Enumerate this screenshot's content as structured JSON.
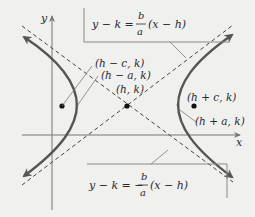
{
  "diagram": {
    "colors": {
      "background": "#f0f0ef",
      "curve": "#555555",
      "asymptote": "#444444",
      "axis": "#777777",
      "leader": "#7a7a7a",
      "point": "#111111",
      "text": "#2a2a2a"
    },
    "axes": {
      "x_label": "x",
      "y_label": "y"
    },
    "asymptotes": {
      "upper_right": {
        "lhs": "y − k =",
        "numerator": "b",
        "denominator": "a",
        "rhs": "(x − h)"
      },
      "lower_right": {
        "lhs": "y − k = −",
        "numerator": "b",
        "denominator": "a",
        "rhs": "(x − h)"
      }
    },
    "points": [
      {
        "name": "left-focus",
        "label": "(h − c, k)"
      },
      {
        "name": "left-vertex",
        "label": "(h − a, k)"
      },
      {
        "name": "center",
        "label": "(h, k)"
      },
      {
        "name": "right-focus",
        "label": "(h + c, k)"
      },
      {
        "name": "right-vertex",
        "label": "(h + a, k)"
      }
    ]
  }
}
